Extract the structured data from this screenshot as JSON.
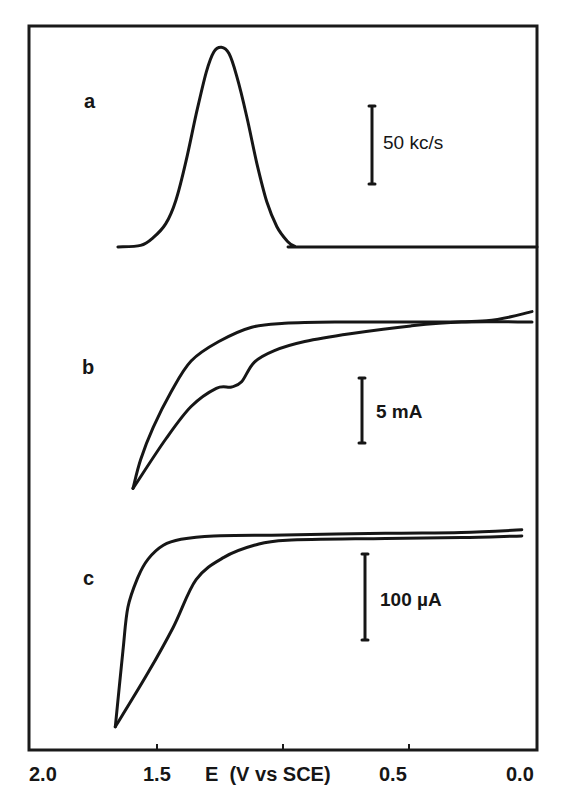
{
  "chart_data": {
    "type": "line",
    "title": "",
    "xlabel": "E  (V vs SCE)",
    "ylabel": "",
    "xlim": [
      2.0,
      0.0
    ],
    "x_reversed": true,
    "x_ticks": [
      2.0,
      1.5,
      1.0,
      0.5,
      0.0
    ],
    "x_tick_labels": [
      "2.0",
      "1.5",
      "",
      "0.5",
      "0.0"
    ],
    "grid": false,
    "legend": null,
    "panels": [
      {
        "label": "a",
        "scale_bar": {
          "label": "50 kc/s",
          "value": 50,
          "unit": "kc/s"
        },
        "series": [
          {
            "name": "a",
            "points": [
              [
                1.66,
                0
              ],
              [
                1.57,
                1
              ],
              [
                1.52,
                6
              ],
              [
                1.47,
                15
              ],
              [
                1.43,
                30
              ],
              [
                1.39,
                55
              ],
              [
                1.35,
                85
              ],
              [
                1.31,
                112
              ],
              [
                1.28,
                125
              ],
              [
                1.25,
                128
              ],
              [
                1.22,
                124
              ],
              [
                1.19,
                110
              ],
              [
                1.15,
                84
              ],
              [
                1.11,
                54
              ],
              [
                1.07,
                29
              ],
              [
                1.03,
                13
              ],
              [
                0.99,
                4
              ],
              [
                0.96,
                0.5
              ],
              [
                0.9,
                0
              ],
              [
                0.0,
                0
              ]
            ]
          }
        ]
      },
      {
        "label": "b",
        "scale_bar": {
          "label": "5 mA",
          "value": 5,
          "unit": "mA"
        },
        "series": [
          {
            "name": "b-forward",
            "points": [
              [
                0.02,
                0.8
              ],
              [
                0.2,
                0.1
              ],
              [
                0.5,
                0.0
              ],
              [
                0.8,
                0.0
              ],
              [
                1.0,
                -0.1
              ],
              [
                1.13,
                -0.4
              ],
              [
                1.26,
                -1.5
              ],
              [
                1.37,
                -3.0
              ],
              [
                1.45,
                -5.4
              ],
              [
                1.52,
                -8.1
              ],
              [
                1.57,
                -10.6
              ],
              [
                1.6,
                -12.8
              ]
            ]
          },
          {
            "name": "b-reverse",
            "points": [
              [
                1.6,
                -12.8
              ],
              [
                1.47,
                -9.0
              ],
              [
                1.37,
                -6.5
              ],
              [
                1.27,
                -5.1
              ],
              [
                1.21,
                -5.0
              ],
              [
                1.17,
                -4.6
              ],
              [
                1.12,
                -3.1
              ],
              [
                1.04,
                -2.2
              ],
              [
                0.92,
                -1.5
              ],
              [
                0.74,
                -0.9
              ],
              [
                0.5,
                -0.3
              ],
              [
                0.3,
                0.0
              ],
              [
                0.02,
                0.0
              ]
            ]
          }
        ]
      },
      {
        "label": "c",
        "scale_bar": {
          "label": "100 µA",
          "value": 100,
          "unit": "µA"
        },
        "series": [
          {
            "name": "c-forward",
            "points": [
              [
                0.06,
                6
              ],
              [
                0.3,
                3
              ],
              [
                0.6,
                2
              ],
              [
                1.0,
                0
              ],
              [
                1.28,
                -1
              ],
              [
                1.41,
                -5
              ],
              [
                1.48,
                -12
              ],
              [
                1.54,
                -28
              ],
              [
                1.58,
                -49
              ],
              [
                1.62,
                -84
              ],
              [
                1.64,
                -135
              ],
              [
                1.67,
                -223
              ]
            ]
          },
          {
            "name": "c-reverse",
            "points": [
              [
                1.67,
                -223
              ],
              [
                1.54,
                -160
              ],
              [
                1.44,
                -107
              ],
              [
                1.35,
                -52
              ],
              [
                1.24,
                -26
              ],
              [
                1.12,
                -12
              ],
              [
                0.99,
                -6
              ],
              [
                0.6,
                -4
              ],
              [
                0.3,
                -3
              ],
              [
                0.06,
                -1
              ]
            ]
          }
        ]
      }
    ]
  }
}
